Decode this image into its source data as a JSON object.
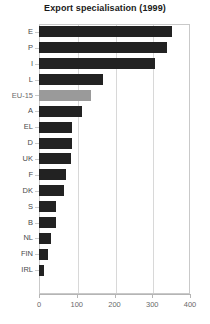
{
  "chart_data": {
    "type": "bar",
    "orientation": "horizontal",
    "title": "Export specialisation (1999)",
    "xlabel": "",
    "ylabel": "",
    "xlim": [
      0,
      400
    ],
    "xticks": [
      0,
      100,
      200,
      300,
      400
    ],
    "grid": true,
    "legend": null,
    "categories": [
      "E",
      "P",
      "I",
      "L",
      "EU-15",
      "A",
      "EL",
      "D",
      "UK",
      "F",
      "DK",
      "S",
      "B",
      "NL",
      "FIN",
      "IRL"
    ],
    "values": [
      353,
      339,
      307,
      170,
      138,
      114,
      87,
      87,
      85,
      72,
      66,
      45,
      45,
      32,
      24,
      13
    ],
    "highlight_category": "EU-15",
    "colors": {
      "bar": "#222222",
      "bar_highlight": "#9a9a9a",
      "axis": "#b5b5b5",
      "grid": "#d8d8d8",
      "title": "#1a1a1a",
      "tick_label": "#6a6a6a",
      "category_label": "#4a4a4a"
    }
  }
}
